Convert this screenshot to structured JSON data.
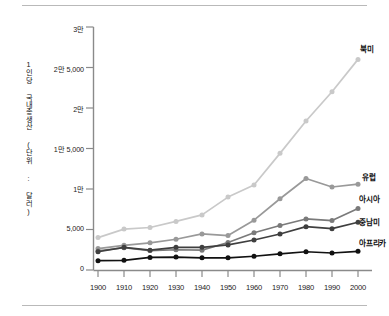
{
  "chart_data": {
    "type": "line",
    "title": "",
    "xlabel": "",
    "ylabel": "1인당 국내총생산 (단위 : 달러)",
    "categories": [
      "1900",
      "1910",
      "1920",
      "1930",
      "1940",
      "1950",
      "1960",
      "1970",
      "1980",
      "1990",
      "2000"
    ],
    "x": [
      1900,
      1910,
      1920,
      1930,
      1940,
      1950,
      1960,
      1970,
      1980,
      1990,
      2000
    ],
    "xlim": [
      1900,
      2000
    ],
    "ylim": [
      0,
      30000
    ],
    "ytick_values": [
      0,
      5000,
      10000,
      15000,
      20000,
      25000,
      30000
    ],
    "ytick_labels": [
      "0",
      "5,000",
      "1만",
      "1만 5,000",
      "2만",
      "2만 5,000",
      "3만"
    ],
    "grid": false,
    "legend_position": "right-inline",
    "series": [
      {
        "name": "북미",
        "color": "#c9c9c9",
        "values": [
          4000,
          5050,
          5250,
          6000,
          6800,
          9000,
          10500,
          14400,
          18400,
          22000,
          26000
        ]
      },
      {
        "name": "유럽",
        "color": "#999999",
        "values": [
          2650,
          3050,
          3350,
          3800,
          4450,
          4250,
          6150,
          8800,
          11300,
          10250,
          10600
        ]
      },
      {
        "name": "아시아",
        "color": "#7a7a7a",
        "values": [
          2350,
          2750,
          2400,
          2500,
          2450,
          3400,
          4600,
          5500,
          6300,
          6100,
          7600
        ]
      },
      {
        "name": "중남미",
        "color": "#3f3f3f",
        "values": [
          2250,
          2800,
          2450,
          2800,
          2800,
          3100,
          3700,
          4450,
          5350,
          5100,
          5900
        ]
      },
      {
        "name": "아프리카",
        "color": "#111111",
        "values": [
          1150,
          1200,
          1550,
          1600,
          1500,
          1500,
          1700,
          2000,
          2250,
          2100,
          2300
        ]
      }
    ]
  },
  "axes": {
    "ytick_labels": [
      "3만",
      "2만 5,000",
      "2만",
      "1만 5,000",
      "1만",
      "5,000",
      "0"
    ],
    "xtick_labels": [
      "1900",
      "1910",
      "1920",
      "1930",
      "1940",
      "1950",
      "1960",
      "1970",
      "1980",
      "1990",
      "2000"
    ],
    "ylabel": "1인당 국내총생산 (단위 : 달러)"
  },
  "series_labels": {
    "north_america": "북미",
    "europe": "유럽",
    "asia": "아시아",
    "latin_america": "중남미",
    "africa": "아프리카"
  }
}
